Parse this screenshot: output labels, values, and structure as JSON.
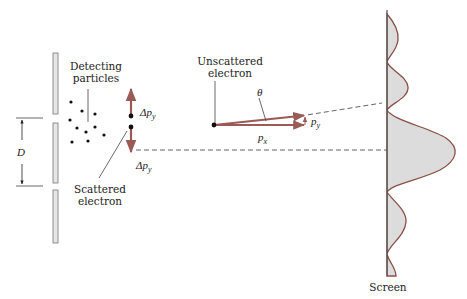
{
  "diagram": {
    "labels": {
      "detecting_line1": "Detecting",
      "detecting_line2": "particles",
      "scattered_line1": "Scattered",
      "scattered_line2": "electron",
      "unscattered_line1": "Unscattered",
      "unscattered_line2": "electron",
      "screen": "Screen",
      "slit_separation": "D",
      "theta": "θ",
      "delta_py_top": "Δp",
      "delta_py_bottom": "Δp",
      "py_main": "p",
      "py_sub": "y",
      "px_main": "p",
      "px_sub": "x",
      "dpy_sub": "y"
    },
    "colors": {
      "momentum_arrow": "#9a5a55",
      "intensity_curve": "#8a4f45",
      "screen_fill": "#dcdcdc",
      "barrier_fill": "#e6e6e6",
      "line": "#333333"
    }
  }
}
